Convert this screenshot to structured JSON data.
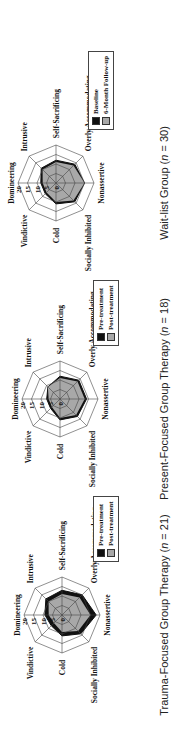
{
  "figure": {
    "orientation": "rotated-90-ccw",
    "colors": {
      "pre": "#111111",
      "post": "#a8a8a8",
      "grid": "#444444"
    }
  },
  "chart_data": [
    {
      "type": "radar",
      "title": "Trauma-Focused Group Therapy",
      "caption_prefix": "Trauma-Focused Group Therapy (",
      "n_label": "n",
      "n_value": " = 21)",
      "axes": [
        "Domineering",
        "Intrusive",
        "Self-Sacrificing",
        "Overly Accommodating",
        "Nonassertive",
        "Socially Inhibited",
        "Cold",
        "Vindictive"
      ],
      "ticks": [
        "0",
        "5",
        "10",
        "15",
        "20"
      ],
      "rlim": [
        0,
        20
      ],
      "legend": [
        "Pre-treatment",
        "Post-treatment"
      ],
      "series": [
        {
          "name": "Pre-treatment",
          "values": [
            9,
            12,
            13,
            15,
            18,
            14,
            11,
            8
          ]
        },
        {
          "name": "Post-treatment",
          "values": [
            7,
            10,
            11,
            13,
            15,
            12,
            9,
            6
          ]
        }
      ]
    },
    {
      "type": "radar",
      "title": "Present-Focused Group Therapy",
      "caption_prefix": "Present-Focused Group Therapy (",
      "n_label": "n",
      "n_value": " = 18)",
      "axes": [
        "Domineering",
        "Intrusive",
        "Self-Sacrificing",
        "Overly Accommodating",
        "Nonassertive",
        "Socially Inhibited",
        "Cold",
        "Vindictive"
      ],
      "ticks": [
        "0",
        "5",
        "10",
        "15",
        "20"
      ],
      "rlim": [
        0,
        20
      ],
      "legend": [
        "Pre-treatment",
        "Post-treatment"
      ],
      "series": [
        {
          "name": "Pre-treatment",
          "values": [
            7,
            9,
            12,
            14,
            14,
            13,
            11,
            7
          ]
        },
        {
          "name": "Post-treatment",
          "values": [
            6,
            9,
            11,
            13,
            13,
            12,
            10,
            6
          ]
        }
      ]
    },
    {
      "type": "radar",
      "title": "Wait-list Group",
      "caption_prefix": "Wait-list Group (",
      "n_label": "n",
      "n_value": " = 30)",
      "axes": [
        "Domineering",
        "Intrusive",
        "Self-Sacrificing",
        "Overly Accommodating",
        "Nonassertive",
        "Socially Inhibited",
        "Cold",
        "Vindictive"
      ],
      "ticks": [
        "0",
        "5",
        "10",
        "15",
        "20"
      ],
      "rlim": [
        0,
        20
      ],
      "legend": [
        "Baseline",
        "6-Month Follow-up"
      ],
      "series": [
        {
          "name": "Baseline",
          "values": [
            8,
            11,
            12,
            14,
            15,
            14,
            11,
            8
          ]
        },
        {
          "name": "6-Month Follow-up",
          "values": [
            7,
            10,
            11,
            13,
            15,
            13,
            10,
            7
          ]
        }
      ]
    }
  ]
}
